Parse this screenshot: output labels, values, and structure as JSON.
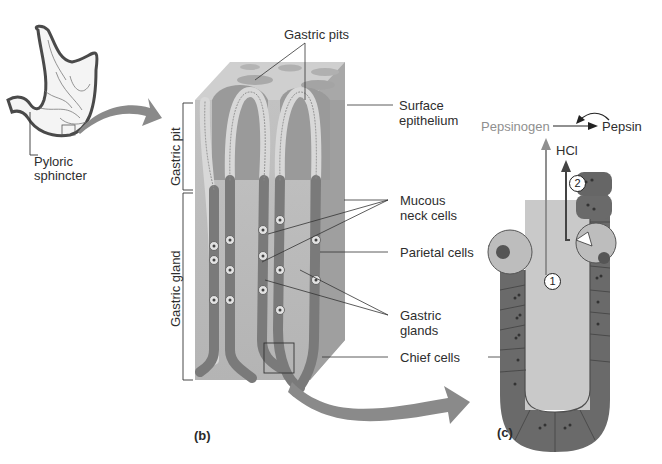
{
  "figure": {
    "panels": [
      {
        "id": "b",
        "label": "(b)"
      },
      {
        "id": "c",
        "label": "(c)"
      }
    ],
    "stomach": {
      "label_line1": "Pyloric",
      "label_line2": "sphincter"
    },
    "block_labels": {
      "gastric_pits": "Gastric pits",
      "surface_epithelium_1": "Surface",
      "surface_epithelium_2": "epithelium",
      "mucous_neck_cells_1": "Mucous",
      "mucous_neck_cells_2": "neck cells",
      "parietal_cells": "Parietal cells",
      "gastric_glands_1": "Gastric",
      "gastric_glands_2": "glands",
      "chief_cells": "Chief cells",
      "gastric_pit_bracket": "Gastric pit",
      "gastric_gland_bracket": "Gastric gland"
    },
    "reaction": {
      "pepsinogen": "Pepsinogen",
      "pepsin": "Pepsin",
      "hcl": "HCl",
      "step1": "1",
      "step2": "2"
    },
    "colors": {
      "tissue_dark": "#6e6e6e",
      "tissue_mid": "#9a9a9a",
      "tissue_light": "#c4c4c4",
      "arrow_gray": "#8a8a8a",
      "pepsinogen_gray": "#8f8f8f"
    }
  }
}
